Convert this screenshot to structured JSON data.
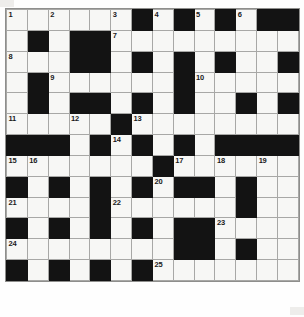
{
  "puzzle": {
    "type": "crossword-grid",
    "rows": 14,
    "cols": 14,
    "cell_size_px": 21,
    "colors": {
      "empty_cell": "#f7f7f5",
      "block_cell": "#131313",
      "grid_line": "#a8a8a6",
      "number": "#1a1a1a",
      "page_background": "#ffffff"
    },
    "clue_numbers": [
      1,
      2,
      3,
      4,
      5,
      6,
      7,
      8,
      9,
      10,
      11,
      12,
      13,
      14,
      15,
      16,
      17,
      18,
      19,
      20,
      21,
      22,
      23,
      24,
      25
    ],
    "grid": [
      [
        {
          "b": false,
          "n": "1"
        },
        {
          "b": false
        },
        {
          "b": false,
          "n": "2"
        },
        {
          "b": false
        },
        {
          "b": false
        },
        {
          "b": false,
          "n": "3"
        },
        {
          "b": true
        },
        {
          "b": false,
          "n": "4"
        },
        {
          "b": true
        },
        {
          "b": false,
          "n": "5"
        },
        {
          "b": true
        },
        {
          "b": false,
          "n": "6"
        },
        {
          "b": true
        },
        {
          "b": true
        }
      ],
      [
        {
          "b": false
        },
        {
          "b": true
        },
        {
          "b": false
        },
        {
          "b": true
        },
        {
          "b": true
        },
        {
          "b": false,
          "n": "7"
        },
        {
          "b": false
        },
        {
          "b": false
        },
        {
          "b": false
        },
        {
          "b": false
        },
        {
          "b": false
        },
        {
          "b": false
        },
        {
          "b": false
        },
        {
          "b": false
        }
      ],
      [
        {
          "b": false,
          "n": "8"
        },
        {
          "b": false
        },
        {
          "b": false
        },
        {
          "b": true
        },
        {
          "b": true
        },
        {
          "b": false
        },
        {
          "b": true
        },
        {
          "b": false
        },
        {
          "b": true
        },
        {
          "b": false
        },
        {
          "b": true
        },
        {
          "b": false
        },
        {
          "b": false
        },
        {
          "b": true
        }
      ],
      [
        {
          "b": false
        },
        {
          "b": true
        },
        {
          "b": false,
          "n": "9"
        },
        {
          "b": false
        },
        {
          "b": false
        },
        {
          "b": false
        },
        {
          "b": false
        },
        {
          "b": false
        },
        {
          "b": true
        },
        {
          "b": false,
          "n": "10"
        },
        {
          "b": false
        },
        {
          "b": false
        },
        {
          "b": false
        },
        {
          "b": false
        }
      ],
      [
        {
          "b": false
        },
        {
          "b": true
        },
        {
          "b": false
        },
        {
          "b": true
        },
        {
          "b": true
        },
        {
          "b": false
        },
        {
          "b": true
        },
        {
          "b": false
        },
        {
          "b": true
        },
        {
          "b": false
        },
        {
          "b": false
        },
        {
          "b": true
        },
        {
          "b": false
        },
        {
          "b": true
        }
      ],
      [
        {
          "b": false,
          "n": "11"
        },
        {
          "b": false
        },
        {
          "b": false
        },
        {
          "b": false,
          "n": "12"
        },
        {
          "b": false
        },
        {
          "b": true
        },
        {
          "b": false,
          "n": "13"
        },
        {
          "b": false
        },
        {
          "b": false
        },
        {
          "b": false
        },
        {
          "b": false
        },
        {
          "b": false
        },
        {
          "b": false
        },
        {
          "b": false
        }
      ],
      [
        {
          "b": true
        },
        {
          "b": true
        },
        {
          "b": true
        },
        {
          "b": false
        },
        {
          "b": true
        },
        {
          "b": false,
          "n": "14"
        },
        {
          "b": true
        },
        {
          "b": false
        },
        {
          "b": true
        },
        {
          "b": false
        },
        {
          "b": true
        },
        {
          "b": true
        },
        {
          "b": true
        },
        {
          "b": true
        }
      ],
      [
        {
          "b": false,
          "n": "15"
        },
        {
          "b": false,
          "n": "16"
        },
        {
          "b": false
        },
        {
          "b": false
        },
        {
          "b": false
        },
        {
          "b": false
        },
        {
          "b": false
        },
        {
          "b": true
        },
        {
          "b": false,
          "n": "17"
        },
        {
          "b": false
        },
        {
          "b": false,
          "n": "18"
        },
        {
          "b": false
        },
        {
          "b": false,
          "n": "19"
        },
        {
          "b": false
        }
      ],
      [
        {
          "b": true
        },
        {
          "b": false
        },
        {
          "b": true
        },
        {
          "b": false
        },
        {
          "b": true
        },
        {
          "b": false
        },
        {
          "b": true
        },
        {
          "b": false,
          "n": "20"
        },
        {
          "b": true
        },
        {
          "b": true
        },
        {
          "b": false
        },
        {
          "b": true
        },
        {
          "b": false
        },
        {
          "b": false
        }
      ],
      [
        {
          "b": false,
          "n": "21"
        },
        {
          "b": false
        },
        {
          "b": false
        },
        {
          "b": false
        },
        {
          "b": true
        },
        {
          "b": false,
          "n": "22"
        },
        {
          "b": false
        },
        {
          "b": false
        },
        {
          "b": false
        },
        {
          "b": false
        },
        {
          "b": false
        },
        {
          "b": true
        },
        {
          "b": false
        },
        {
          "b": false
        }
      ],
      [
        {
          "b": true
        },
        {
          "b": false
        },
        {
          "b": true
        },
        {
          "b": false
        },
        {
          "b": true
        },
        {
          "b": false
        },
        {
          "b": true
        },
        {
          "b": false
        },
        {
          "b": true
        },
        {
          "b": true
        },
        {
          "b": false,
          "n": "23"
        },
        {
          "b": false
        },
        {
          "b": false
        },
        {
          "b": false
        }
      ],
      [
        {
          "b": false,
          "n": "24"
        },
        {
          "b": false
        },
        {
          "b": false
        },
        {
          "b": false
        },
        {
          "b": false
        },
        {
          "b": false
        },
        {
          "b": false
        },
        {
          "b": false
        },
        {
          "b": true
        },
        {
          "b": true
        },
        {
          "b": false
        },
        {
          "b": true
        },
        {
          "b": false
        },
        {
          "b": false
        }
      ],
      [
        {
          "b": true
        },
        {
          "b": false
        },
        {
          "b": true
        },
        {
          "b": false
        },
        {
          "b": true
        },
        {
          "b": false
        },
        {
          "b": true
        },
        {
          "b": false,
          "n": "25"
        },
        {
          "b": false
        },
        {
          "b": false
        },
        {
          "b": false
        },
        {
          "b": false
        },
        {
          "b": false
        },
        {
          "b": false
        }
      ]
    ]
  }
}
